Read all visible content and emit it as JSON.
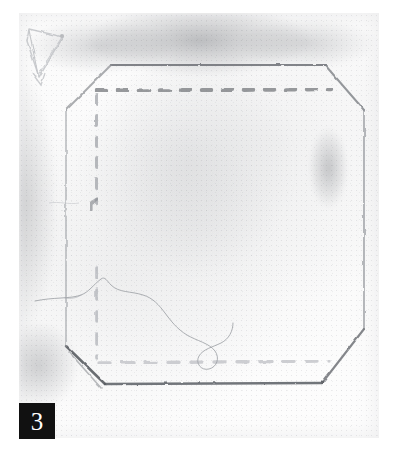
{
  "figure": {
    "label": "3",
    "caption_text": "3",
    "badge_bg": "#111111",
    "badge_fg": "#ffffff"
  },
  "media": {
    "kind": "scanned-pencil-sketch",
    "subject": "chamfered-square-fabric-panel",
    "paper_color": "#fbfbfb",
    "page_background": "#ffffff",
    "ink_color": "#6e7176",
    "faint_ink_color": "#b9bbbf"
  },
  "drawing": {
    "outline": {
      "name": "panel-outline",
      "shape": "octagon",
      "description": "square panel with four chamfered corners",
      "stroke_color": "#7b7e83",
      "points": "92,52 306,52 345,96 345,318 302,372 86,372 46,337 46,98"
    },
    "stitch_lines": [
      {
        "name": "stitch-line-top",
        "orientation": "horizontal",
        "dash_count": 12,
        "contrast": "dark",
        "color": "#84878c"
      },
      {
        "name": "stitch-line-right",
        "orientation": "vertical",
        "dash_count": 12,
        "contrast": "dark",
        "color": "#7e8186"
      },
      {
        "name": "stitch-line-left",
        "orientation": "vertical",
        "dash_count": 12,
        "contrast": "faint",
        "color": "#a9acb1"
      },
      {
        "name": "stitch-line-bottom",
        "orientation": "horizontal",
        "dash_count": 12,
        "contrast": "very-faint",
        "color": "#c6c8cc"
      }
    ],
    "annotations": [
      {
        "name": "arrow-annotation",
        "position": "top-left",
        "description": "faint pencil arrow pointing down-left",
        "color": "#bcbec2"
      },
      {
        "name": "loose-thread",
        "position": "lower-left",
        "description": "thin curved thread with a loop",
        "color": "#9ca0a5"
      }
    ]
  }
}
